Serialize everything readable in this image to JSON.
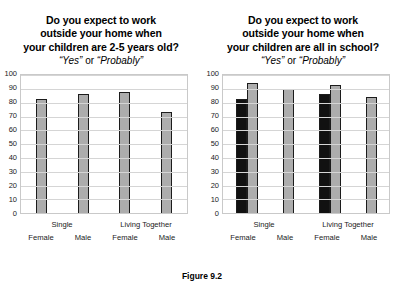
{
  "figure": {
    "caption": "Figure 9.2"
  },
  "chart_data": [
    {
      "type": "bar",
      "panel": "left",
      "title_lines": [
        "Do you expect to work",
        "outside your home when",
        "your children are 2-5 years old?"
      ],
      "subtitle_quote_1": "“Yes”",
      "subtitle_conjunction": " or ",
      "subtitle_quote_2": "“Probably”",
      "categories": [
        "Female",
        "Male",
        "Female",
        "Male"
      ],
      "group_labels": [
        "Single",
        "Living Together"
      ],
      "series": [
        {
          "name": "Response",
          "color": "#adadad",
          "values": [
            83,
            86,
            88,
            73
          ]
        }
      ],
      "ylim": [
        0,
        100
      ],
      "yticks": [
        100,
        90,
        80,
        70,
        60,
        50,
        40,
        30,
        20,
        10,
        0
      ],
      "xlabel": "",
      "ylabel": "",
      "grid": true,
      "legend": "none"
    },
    {
      "type": "bar",
      "panel": "right",
      "title_lines": [
        "Do you expect to work",
        "outside your home when",
        "your children are all in school?"
      ],
      "subtitle_quote_1": "“Yes”",
      "subtitle_conjunction": " or ",
      "subtitle_quote_2": "“Probably”",
      "categories": [
        "Female",
        "Male",
        "Female",
        "Male"
      ],
      "group_labels": [
        "Single",
        "Living Together"
      ],
      "series": [
        {
          "name": "Black series",
          "color": "#111111",
          "values": [
            83,
            null,
            86,
            null
          ]
        },
        {
          "name": "Gray series",
          "color": "#adadad",
          "values": [
            94,
            90,
            93,
            84
          ]
        }
      ],
      "ylim": [
        0,
        100
      ],
      "yticks": [
        100,
        90,
        80,
        70,
        60,
        50,
        40,
        30,
        20,
        10,
        0
      ],
      "xlabel": "",
      "ylabel": "",
      "grid": true,
      "legend": "none"
    }
  ]
}
